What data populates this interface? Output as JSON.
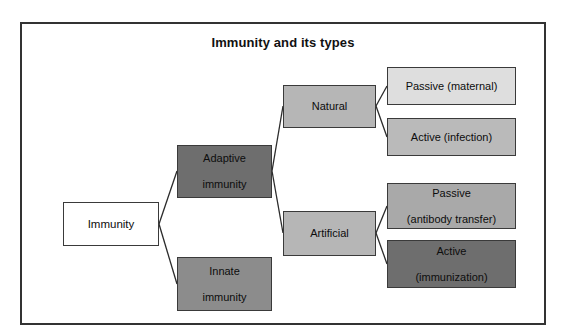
{
  "diagram": {
    "title": "Immunity and its types",
    "type": "tree-flowchart",
    "frame": {
      "border_color": "#333333"
    },
    "nodes": [
      {
        "id": "immunity",
        "label": "Immunity",
        "fill": "#ffffff",
        "level": 0
      },
      {
        "id": "adaptive",
        "label": "Adaptive\nimmunity",
        "line1": "Adaptive",
        "line2": "immunity",
        "fill": "#6e6e6e",
        "level": 1
      },
      {
        "id": "innate",
        "label": "Innate\nimmunity",
        "line1": "Innate",
        "line2": "immunity",
        "fill": "#8c8c8c",
        "level": 1
      },
      {
        "id": "natural",
        "label": "Natural",
        "fill": "#b6b6b6",
        "level": 2
      },
      {
        "id": "artificial",
        "label": "Artificial",
        "fill": "#b6b6b6",
        "level": 2
      },
      {
        "id": "passive_maternal",
        "label": "Passive (maternal)",
        "fill": "#dedede",
        "level": 3
      },
      {
        "id": "active_infection",
        "label": "Active (infection)",
        "fill": "#bababa",
        "level": 3
      },
      {
        "id": "passive_antibody",
        "line1": "Passive",
        "line2": "(antibody transfer)",
        "fill": "#a9a9a9",
        "level": 3
      },
      {
        "id": "active_immunization",
        "line1": "Active",
        "line2": "(immunization)",
        "fill": "#6e6e6e",
        "level": 3
      }
    ],
    "edges": [
      {
        "from": "immunity",
        "to": "adaptive"
      },
      {
        "from": "immunity",
        "to": "innate"
      },
      {
        "from": "adaptive",
        "to": "natural"
      },
      {
        "from": "adaptive",
        "to": "artificial"
      },
      {
        "from": "natural",
        "to": "passive_maternal"
      },
      {
        "from": "natural",
        "to": "active_infection"
      },
      {
        "from": "artificial",
        "to": "passive_antibody"
      },
      {
        "from": "artificial",
        "to": "active_immunization"
      }
    ]
  }
}
